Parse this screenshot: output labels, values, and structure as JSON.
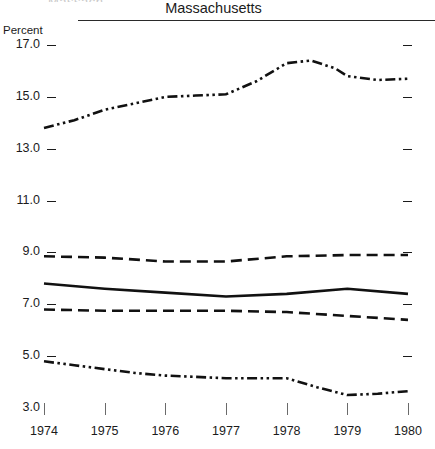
{
  "header": {
    "clipped_text": "Massach",
    "title": "Massachusetts"
  },
  "axis": {
    "unit_label": "Percent",
    "y_ticks": [
      "17.0",
      "15.0",
      "13.0",
      "11.0",
      "9.0",
      "7.0",
      "5.0",
      "3.0"
    ],
    "x_ticks": [
      "1974",
      "1975",
      "1976",
      "1977",
      "1978",
      "1979",
      "1980"
    ]
  },
  "colors": {
    "line": "#111111",
    "axis": "#1b1b1b",
    "rule": "#2a2a2a",
    "xtick": "#6a6a6a",
    "background": "#ffffff"
  },
  "chart_data": {
    "type": "line",
    "title": "Massachusetts",
    "xlabel": "",
    "ylabel": "Percent",
    "xlim": [
      1974,
      1980
    ],
    "ylim": [
      3.0,
      17.0
    ],
    "grid": false,
    "legend": "none",
    "x": [
      1974,
      1975,
      1976,
      1977,
      1978,
      1979,
      1980
    ],
    "series": [
      {
        "name": "series-1",
        "style": "dash-dot-dot",
        "values": [
          13.8,
          14.5,
          15.0,
          15.1,
          16.3,
          15.8,
          15.7
        ],
        "detail_x": [
          1974,
          1974.5,
          1975,
          1975.5,
          1976,
          1976.5,
          1977,
          1977.5,
          1978,
          1978.4,
          1978.8,
          1979,
          1979.5,
          1980
        ],
        "detail_values": [
          13.8,
          14.1,
          14.5,
          14.75,
          15.0,
          15.05,
          15.1,
          15.6,
          16.3,
          16.4,
          16.1,
          15.8,
          15.65,
          15.7
        ]
      },
      {
        "name": "series-2",
        "style": "dashed",
        "values": [
          8.85,
          8.8,
          8.65,
          8.65,
          8.85,
          8.9,
          8.9
        ],
        "detail_x": [
          1974,
          1975,
          1976,
          1977,
          1978,
          1979,
          1980
        ],
        "detail_values": [
          8.85,
          8.8,
          8.65,
          8.65,
          8.85,
          8.9,
          8.9
        ]
      },
      {
        "name": "series-3",
        "style": "solid",
        "values": [
          7.8,
          7.6,
          7.45,
          7.3,
          7.4,
          7.6,
          7.4
        ],
        "detail_x": [
          1974,
          1975,
          1976,
          1977,
          1978,
          1979,
          1980
        ],
        "detail_values": [
          7.8,
          7.6,
          7.45,
          7.3,
          7.4,
          7.6,
          7.4
        ]
      },
      {
        "name": "series-4",
        "style": "dashed",
        "values": [
          6.8,
          6.75,
          6.75,
          6.75,
          6.7,
          6.55,
          6.4
        ],
        "detail_x": [
          1974,
          1975,
          1976,
          1977,
          1978,
          1979,
          1980
        ],
        "detail_values": [
          6.8,
          6.75,
          6.75,
          6.75,
          6.7,
          6.55,
          6.4
        ]
      },
      {
        "name": "series-5",
        "style": "dash-dot-dot",
        "values": [
          4.8,
          4.5,
          4.25,
          4.15,
          4.15,
          3.5,
          3.65
        ],
        "detail_x": [
          1974,
          1974.5,
          1975,
          1975.5,
          1976,
          1976.5,
          1977,
          1977.5,
          1978,
          1978.5,
          1979,
          1979.5,
          1980
        ],
        "detail_values": [
          4.8,
          4.65,
          4.5,
          4.35,
          4.25,
          4.2,
          4.15,
          4.15,
          4.15,
          3.8,
          3.5,
          3.55,
          3.65
        ]
      }
    ]
  }
}
